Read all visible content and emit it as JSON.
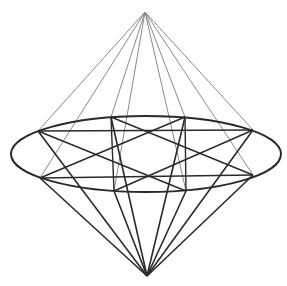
{
  "figure": {
    "width": 287,
    "height": 286,
    "background": "#ffffff",
    "stroke_dark": "#2a2a2a",
    "stroke_light": "#8a8a8a",
    "top_apex": [
      145,
      12
    ],
    "bottom_apex": [
      147,
      276
    ],
    "ellipse": {
      "cx": 146,
      "cy": 154,
      "rx": 135,
      "ry": 38
    },
    "points": [
      [
        38,
        131
      ],
      [
        111,
        117
      ],
      [
        185,
        117
      ],
      [
        253,
        130
      ],
      [
        253,
        175
      ],
      [
        186,
        191
      ],
      [
        114,
        191
      ],
      [
        40,
        178
      ]
    ]
  }
}
